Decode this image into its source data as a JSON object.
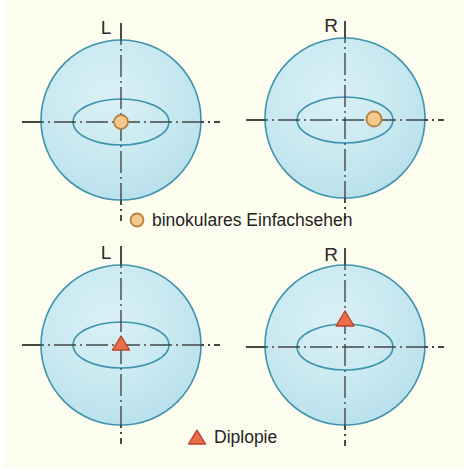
{
  "figure": {
    "background_color": "#fdfdef",
    "outer_circle_fill": "#c2e6ef",
    "outer_circle_stroke": "#3f93ad",
    "inner_ellipse_stroke": "#3f93ad",
    "axis_color": "#3a3a38",
    "circle_marker_fill": "#f5c98e",
    "circle_marker_stroke": "#b7813f",
    "triangle_marker_fill": "#ea6d4c",
    "triangle_marker_stroke": "#b4452c",
    "label_color": "#2b2b28"
  },
  "rows": [
    {
      "id": "row-binocular-single-vision",
      "marker_type": "circle",
      "legend": {
        "label": "binokulares Einfachsehen",
        "marker": "circle-marker-icon"
      },
      "eyes": [
        {
          "id": "eye-left-top",
          "label": "L",
          "cx": 121,
          "cy": 120,
          "r": 80,
          "ellipse_rx": 48,
          "ellipse_ry": 23,
          "marker": {
            "shape": "circle",
            "x": 121,
            "y": 122,
            "size": 8,
            "offset_from_center": "0"
          }
        },
        {
          "id": "eye-right-top",
          "label": "R",
          "cx": 345,
          "cy": 120,
          "r": 80,
          "ellipse_rx": 48,
          "ellipse_ry": 23,
          "marker": {
            "shape": "circle",
            "x": 374,
            "y": 120,
            "size": 8,
            "offset_from_center": "+29 horizontal"
          }
        }
      ]
    },
    {
      "id": "row-diplopia",
      "marker_type": "triangle",
      "legend": {
        "label": "Diplopie",
        "marker": "triangle-marker-icon"
      },
      "eyes": [
        {
          "id": "eye-left-bottom",
          "label": "L",
          "cx": 121,
          "cy": 345,
          "r": 80,
          "ellipse_rx": 48,
          "ellipse_ry": 23,
          "marker": {
            "shape": "triangle",
            "x": 121,
            "y": 345,
            "size": 9,
            "offset_from_center": "0"
          }
        },
        {
          "id": "eye-right-bottom",
          "label": "R",
          "cx": 345,
          "cy": 345,
          "r": 80,
          "ellipse_rx": 48,
          "ellipse_ry": 23,
          "marker": {
            "shape": "triangle",
            "x": 345,
            "y": 320,
            "size": 9,
            "offset_from_center": "-25 vertical"
          }
        }
      ]
    }
  ],
  "legends": {
    "binocular": {
      "label": "binokulares Einfachsehen",
      "marker_x": 137,
      "marker_y": 220,
      "text_x": 152,
      "text_y": 226
    },
    "diplopia": {
      "label": "Diplopie",
      "marker_x": 197,
      "marker_y": 437,
      "text_x": 213,
      "text_y": 443
    }
  }
}
